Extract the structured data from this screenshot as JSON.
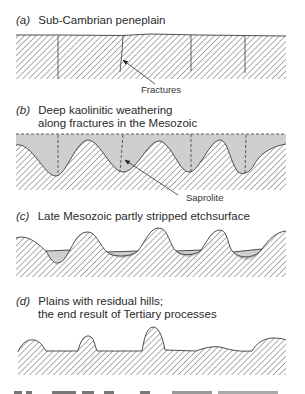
{
  "panels": [
    {
      "id": "a",
      "letter": "(a)",
      "title_lines": [
        "Sub-Cambrian peneplain"
      ],
      "callout": "Fractures"
    },
    {
      "id": "b",
      "letter": "(b)",
      "title_lines": [
        "Deep kaolinitic weathering",
        "along fractures in the Mesozoic"
      ],
      "callout": "Saprolite"
    },
    {
      "id": "c",
      "letter": "(c)",
      "title_lines": [
        "Late Mesozoic partly stripped etchsurface"
      ]
    },
    {
      "id": "d",
      "letter": "(d)",
      "title_lines": [
        "Plains with residual hills;",
        "the end result of Tertiary processes"
      ]
    }
  ],
  "colors": {
    "rock_hatch": "#4a4a4a",
    "saprolite_fill": "#cfcfcf",
    "outline": "#3a3a3a"
  },
  "footer_fragment": "...(caption text cut off at bottom edge)..."
}
